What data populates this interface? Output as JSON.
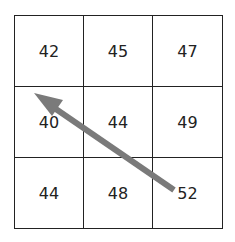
{
  "grid": {
    "rows": [
      [
        "42",
        "45",
        "47"
      ],
      [
        "40",
        "44",
        "49"
      ],
      [
        "44",
        "48",
        "52"
      ]
    ]
  },
  "arrow": {
    "from_cell": "52",
    "to_cell": "42",
    "color": "#7a7a7a"
  }
}
